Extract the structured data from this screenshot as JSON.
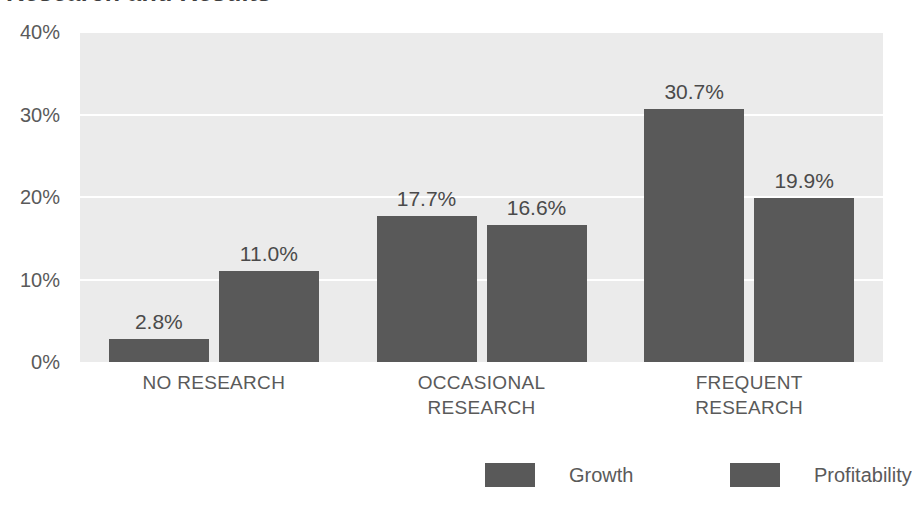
{
  "chart_data": {
    "type": "bar",
    "title": "Research and Results",
    "xlabel": "",
    "ylabel": "",
    "ylim": [
      0,
      40
    ],
    "yticks": [
      40,
      30,
      20,
      10,
      0
    ],
    "ytick_labels": [
      "40%",
      "30%",
      "20%",
      "10%",
      "0%"
    ],
    "grid": true,
    "legend_position": "bottom-right",
    "categories": [
      "NO RESEARCH",
      "OCCASIONAL RESEARCH",
      "FREQUENT RESEARCH"
    ],
    "series": [
      {
        "name": "Growth",
        "color": "#595959",
        "values": [
          2.8,
          17.7,
          30.7
        ],
        "data_labels": [
          "2.8%",
          "17.7%",
          "30.7%"
        ]
      },
      {
        "name": "Profitability",
        "color": "#595959",
        "values": [
          11.0,
          16.6,
          19.9
        ],
        "data_labels": [
          "11.0%",
          "16.6%",
          "19.9%"
        ]
      }
    ]
  },
  "axis": {
    "ticks": [
      {
        "label": "40%",
        "value": 40
      },
      {
        "label": "30%",
        "value": 30
      },
      {
        "label": "20%",
        "value": 20
      },
      {
        "label": "10%",
        "value": 10
      },
      {
        "label": "0%",
        "value": 0
      }
    ]
  },
  "categories": [
    {
      "lines": [
        "NO RESEARCH"
      ]
    },
    {
      "lines": [
        "OCCASIONAL",
        "RESEARCH"
      ]
    },
    {
      "lines": [
        "FREQUENT",
        "RESEARCH"
      ]
    }
  ],
  "legend": {
    "items": [
      {
        "label": "Growth",
        "color": "#595959"
      },
      {
        "label": "Profitability",
        "color": "#595959"
      }
    ]
  },
  "colors": {
    "bar": "#595959",
    "plot_background": "#ebebeb",
    "gridline": "#ffffff",
    "text": "#5a5a5a",
    "page_background": "#ffffff"
  }
}
